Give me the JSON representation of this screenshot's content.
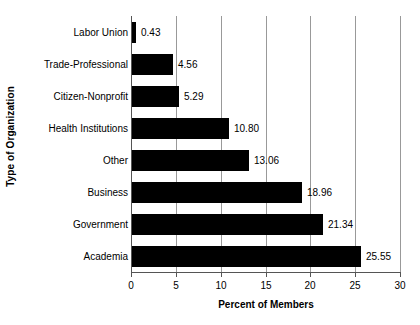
{
  "chart_data": {
    "type": "bar",
    "orientation": "horizontal",
    "title": "",
    "xlabel": "Percent of Members",
    "ylabel": "Type of Organization",
    "categories": [
      "Labor Union",
      "Trade-Professional",
      "Citizen-Nonprofit",
      "Health Institutions",
      "Other",
      "Business",
      "Government",
      "Academia"
    ],
    "values": [
      0.43,
      4.56,
      5.29,
      10.8,
      13.06,
      18.96,
      21.34,
      25.55
    ],
    "value_labels": [
      "0.43",
      "4.56",
      "5.29",
      "10.80",
      "13.06",
      "18.96",
      "21.34",
      "25.55"
    ],
    "xlim": [
      0,
      30
    ],
    "xticks": [
      0,
      5,
      10,
      15,
      20,
      25,
      30
    ],
    "xtick_labels": [
      "0",
      "5",
      "10",
      "15",
      "20",
      "25",
      "30"
    ],
    "grid": "vertical",
    "legend": null,
    "bar_color": "#000000",
    "grid_color": "#999999",
    "axis_color": "#555555",
    "background_color": "#ffffff"
  }
}
